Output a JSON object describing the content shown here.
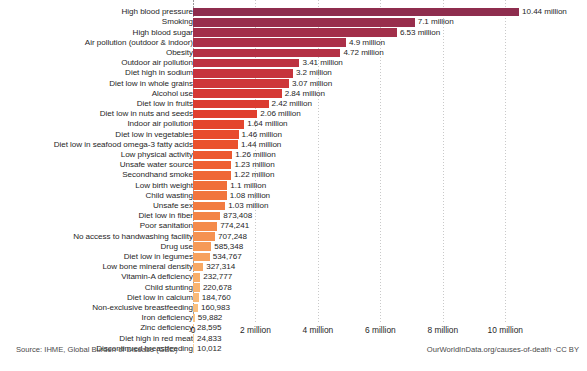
{
  "chart_data": {
    "type": "bar",
    "orientation": "horizontal",
    "title": "",
    "subtitle": "",
    "xlabel": "",
    "ylabel": "",
    "xlim": [
      0,
      11.2
    ],
    "xunit": "million",
    "grid": true,
    "legend": false,
    "xticks": [
      0,
      2,
      4,
      6,
      8,
      10
    ],
    "xtick_labels": [
      "0",
      "2 million",
      "4 million",
      "6 million",
      "8 million",
      "10 million"
    ],
    "categories": [
      "High blood pressure",
      "Smoking",
      "High blood sugar",
      "Air pollution (outdoor & indoor)",
      "Obesity",
      "Outdoor air pollution",
      "Diet high in sodium",
      "Diet low in whole grains",
      "Alcohol use",
      "Diet low in fruits",
      "Diet low in nuts and seeds",
      "Indoor air pollution",
      "Diet low in vegetables",
      "Diet low in seafood omega-3 fatty acids",
      "Low physical activity",
      "Unsafe water source",
      "Secondhand smoke",
      "Low birth weight",
      "Child wasting",
      "Unsafe sex",
      "Diet low in fiber",
      "Poor sanitation",
      "No access to handwashing facility",
      "Drug use",
      "Diet low in legumes",
      "Low bone mineral density",
      "Vitamin-A deficiency",
      "Child stunting",
      "Diet low in calcium",
      "Non-exclusive breastfeeding",
      "Iron deficiency",
      "Zinc deficiency",
      "Diet high in red meat",
      "Discontinued breastfeeding"
    ],
    "values": [
      10440000,
      7100000,
      6530000,
      4900000,
      4720000,
      3410000,
      3200000,
      3070000,
      2840000,
      2420000,
      2060000,
      1640000,
      1460000,
      1440000,
      1260000,
      1230000,
      1220000,
      1100000,
      1080000,
      1030000,
      873408,
      774241,
      707248,
      585348,
      534767,
      327314,
      232777,
      220678,
      184760,
      160983,
      59882,
      28595,
      24833,
      10012
    ],
    "value_labels": [
      "10.44 million",
      "7.1 million",
      "6.53 million",
      "4.9 million",
      "4.72 million",
      "3.41 million",
      "3.2 million",
      "3.07 million",
      "2.84 million",
      "2.42 million",
      "2.06 million",
      "1.64 million",
      "1.46 million",
      "1.44 million",
      "1.26 million",
      "1.23 million",
      "1.22 million",
      "1.1 million",
      "1.08 million",
      "1.03 million",
      "873,408",
      "774,241",
      "707,248",
      "585,348",
      "534,767",
      "327,314",
      "232,777",
      "220,678",
      "184,760",
      "160,983",
      "59,882",
      "28,595",
      "24,833",
      "10,012"
    ],
    "bar_colors": [
      "#8e2d4e",
      "#982e4c",
      "#a22f4a",
      "#ab3048",
      "#b43145",
      "#bd3241",
      "#c6343d",
      "#ce3639",
      "#d53935",
      "#db3c31",
      "#e03f2e",
      "#e4452d",
      "#e84c2d",
      "#ea522e",
      "#ec5930",
      "#ee6033",
      "#ef6736",
      "#f06e39",
      "#f1753d",
      "#f27c41",
      "#f38446",
      "#f48b4b",
      "#f59251",
      "#f69a57",
      "#f7a15d",
      "#f8a863",
      "#f8ae69",
      "#f9b470",
      "#f9ba77",
      "#fac07e",
      "#fac686",
      "#fbcb8e",
      "#fbd096",
      "#fcd49e"
    ]
  },
  "footer": {
    "source": "Source: IHME, Global Burden of Disease (GBD)",
    "attribution": "OurWorldInData.org/causes-of-death ·CC BY"
  }
}
